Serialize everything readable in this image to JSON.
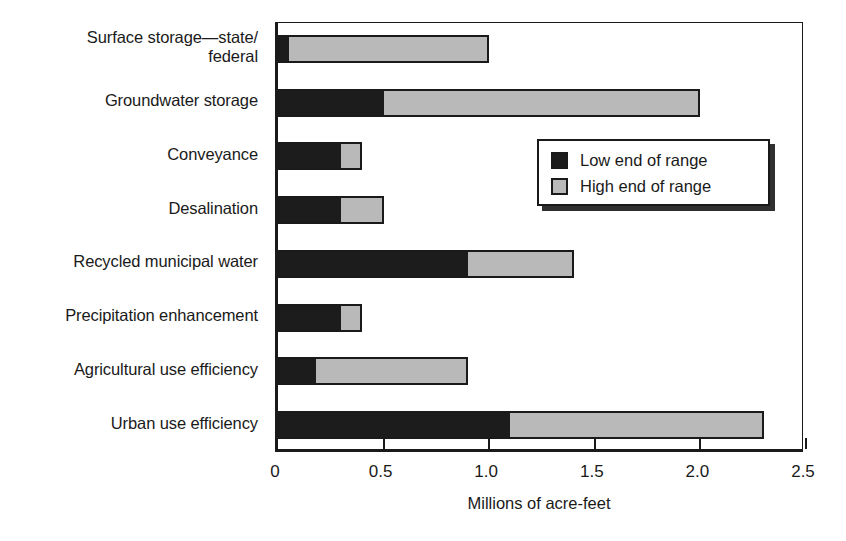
{
  "chart_data": {
    "type": "bar",
    "orientation": "horizontal",
    "title": "",
    "xlabel": "Millions of acre-feet",
    "ylabel": "",
    "xlim": [
      0,
      2.5
    ],
    "xticks": [
      0,
      0.5,
      1.0,
      1.5,
      2.0,
      2.5
    ],
    "xtick_labels": [
      "0",
      "0.5",
      "1.0",
      "1.5",
      "2.0",
      "2.5"
    ],
    "grid": false,
    "legend_position": "upper right inside",
    "categories": [
      "Surface storage—state/\nfederal",
      "Groundwater storage",
      "Conveyance",
      "Desalination",
      "Recycled municipal water",
      "Precipitation enhancement",
      "Agricultural use efficiency",
      "Urban use efficiency"
    ],
    "series": [
      {
        "name": "Low end of range",
        "color": "#1c1c1c",
        "values": [
          0.05,
          0.5,
          0.3,
          0.3,
          0.9,
          0.3,
          0.18,
          1.1
        ]
      },
      {
        "name": "High end of range",
        "color": "#b9b9b9",
        "values": [
          1.0,
          2.0,
          0.4,
          0.5,
          1.4,
          0.4,
          0.9,
          2.3
        ]
      }
    ]
  },
  "legend": {
    "entries": [
      {
        "label": "Low end of range",
        "swatch": "low"
      },
      {
        "label": "High end of range",
        "swatch": "high"
      }
    ]
  }
}
